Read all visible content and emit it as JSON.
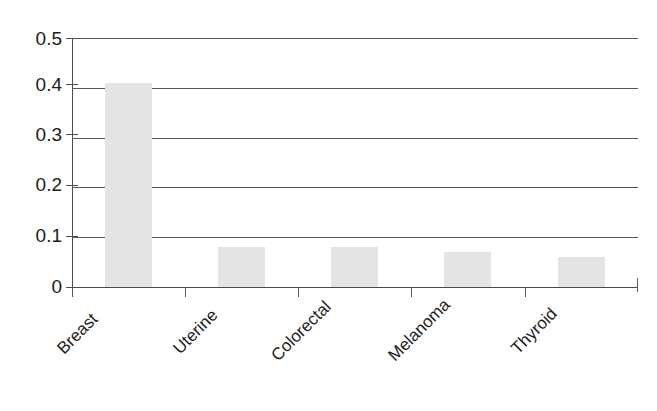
{
  "chart_data": {
    "type": "bar",
    "title": "",
    "subtitle": "",
    "xlabel": "",
    "ylabel": "",
    "categories": [
      "Breast",
      "Uterine",
      "Colorectal",
      "Melanoma",
      "Thyroid"
    ],
    "values": [
      0.41,
      0.08,
      0.08,
      0.07,
      0.06
    ],
    "series": [
      {
        "name": "",
        "values": [
          0.41,
          0.08,
          0.08,
          0.07,
          0.06
        ]
      }
    ],
    "ylim": [
      0,
      0.5
    ],
    "yticks": [
      "0",
      "0.1",
      "0.2",
      "0.3",
      "0.4",
      "0.5"
    ],
    "ytick_values": [
      0,
      0.1,
      0.2,
      0.3,
      0.4,
      0.5
    ],
    "grid": "horizontal",
    "legend": "none",
    "annotations": [],
    "bar_color": "#e4e4e4",
    "axis_color": "#4d4d4d",
    "text_color": "#1c1c1c",
    "background_color": "#ffffff",
    "xtick_label_rotation": "-45"
  },
  "axis": {
    "y_labels": {
      "t5": "0.5",
      "t4": "0.4",
      "t3": "0.3",
      "t2": "0.2",
      "t1": "0.1",
      "t0": "0"
    },
    "x_labels": {
      "c0": "Breast",
      "c1": "Uterine",
      "c2": "Colorectal",
      "c3": "Melanoma",
      "c4": "Thyroid"
    }
  }
}
